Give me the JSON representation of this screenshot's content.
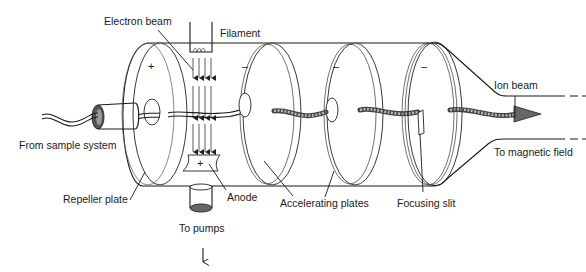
{
  "labels": {
    "electron_beam": "Electron beam",
    "filament": "Filament",
    "from_sample": "From sample system",
    "repeller_plate": "Repeller plate",
    "anode": "Anode",
    "accelerating_plates": "Accelerating plates",
    "focusing_slit": "Focusing slit",
    "ion_beam": "Ion beam",
    "to_magnetic_field": "To magnetic field",
    "to_pumps": "To pumps"
  },
  "signs": {
    "repeller": "+",
    "anode": "+",
    "plate1": "–",
    "plate2": "–",
    "plate3": "–"
  },
  "colors": {
    "line": "#1a1a1a",
    "background": "#ffffff"
  }
}
